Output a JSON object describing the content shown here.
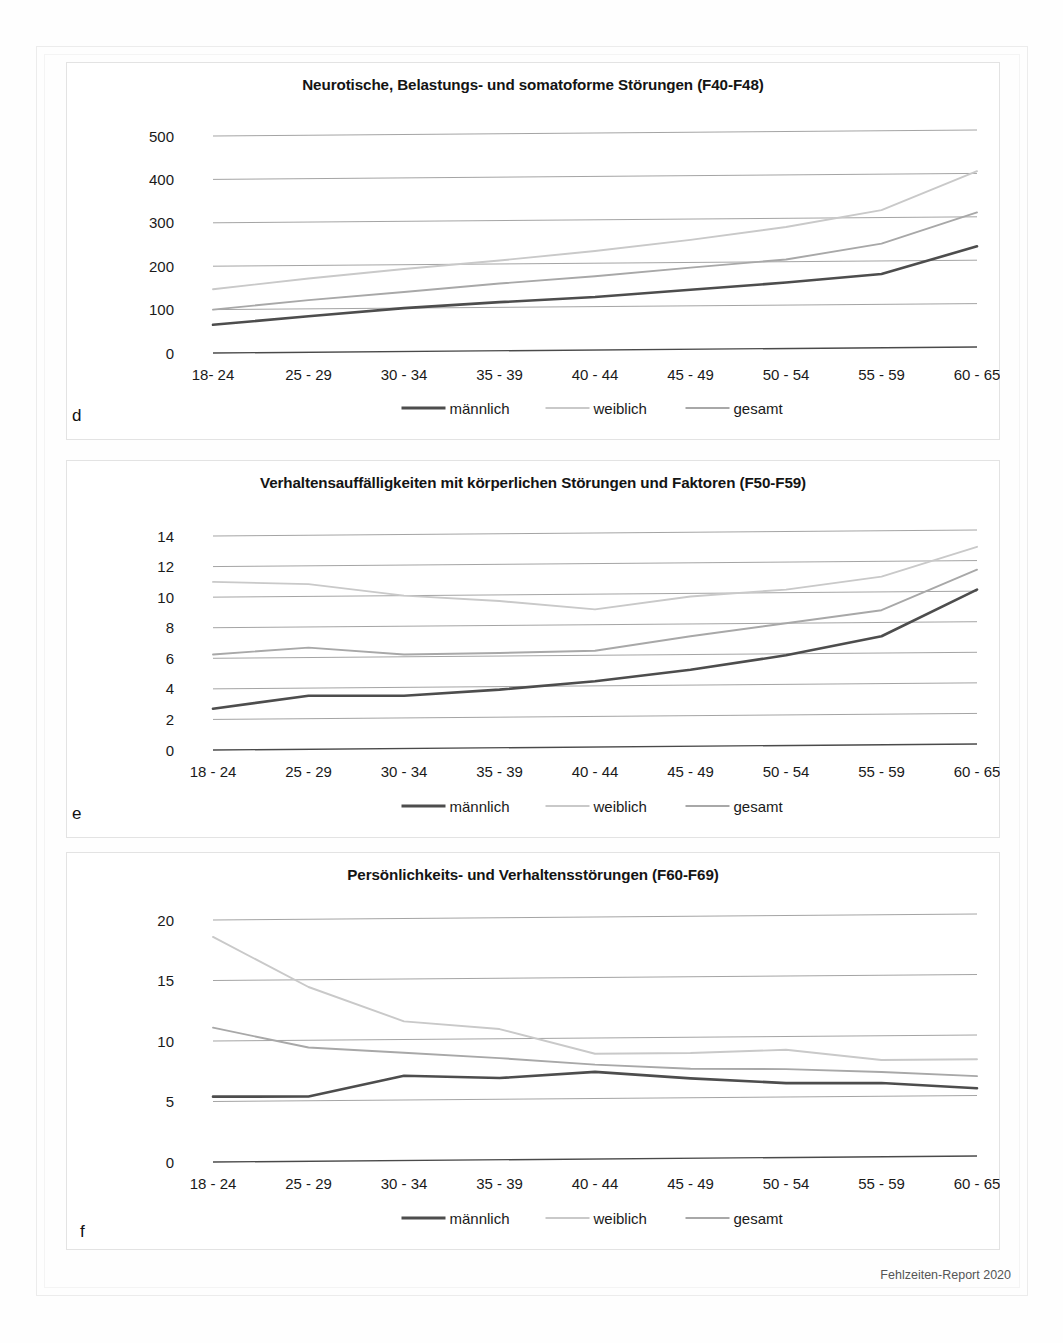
{
  "footer": {
    "text": "Fehlzeiten-Report 2020"
  },
  "legend": {
    "items": [
      {
        "label": "männlich",
        "color": "#4d4d4d"
      },
      {
        "label": "weiblich",
        "color": "#c9c9c9"
      },
      {
        "label": "gesamt",
        "color": "#a8a8a8"
      }
    ]
  },
  "panels": [
    {
      "letter": "d"
    },
    {
      "letter": "e"
    },
    {
      "letter": "f"
    }
  ],
  "chart_data": [
    {
      "type": "line",
      "panel": "d",
      "title": "Neurotische, Belastungs- und somatoforme Störungen (F40-F48)",
      "xlabel": "",
      "ylabel": "",
      "ylim": [
        0,
        500
      ],
      "yticks": [
        0,
        100,
        200,
        300,
        400,
        500
      ],
      "grid": true,
      "legend_position": "bottom",
      "categories": [
        "18- 24",
        "25 - 29",
        "30 - 34",
        "35 - 39",
        "40 - 44",
        "45 - 49",
        "50 - 54",
        "55 - 59",
        "60 - 65"
      ],
      "series": [
        {
          "name": "männlich",
          "color": "#4d4d4d",
          "values": [
            65,
            83,
            100,
            112,
            122,
            137,
            152,
            170,
            232
          ]
        },
        {
          "name": "weiblich",
          "color": "#c9c9c9",
          "values": [
            147,
            170,
            190,
            208,
            228,
            252,
            280,
            317,
            405
          ]
        },
        {
          "name": "gesamt",
          "color": "#a8a8a8",
          "values": [
            100,
            120,
            137,
            155,
            170,
            188,
            205,
            240,
            310
          ]
        }
      ]
    },
    {
      "type": "line",
      "panel": "e",
      "title": "Verhaltensauffälligkeiten mit körperlichen Störungen und Faktoren (F50-F59)",
      "xlabel": "",
      "ylabel": "",
      "ylim": [
        0,
        14
      ],
      "yticks": [
        0,
        2,
        4,
        6,
        8,
        10,
        12,
        14
      ],
      "grid": true,
      "legend_position": "bottom",
      "categories": [
        "18 - 24",
        "25 - 29",
        "30 - 34",
        "35 - 39",
        "40 - 44",
        "45 - 49",
        "50 - 54",
        "55 - 59",
        "60 - 65"
      ],
      "series": [
        {
          "name": "männlich",
          "color": "#4d4d4d",
          "values": [
            2.7,
            3.5,
            3.45,
            3.8,
            4.3,
            5.0,
            5.9,
            7.1,
            10.1
          ]
        },
        {
          "name": "weiblich",
          "color": "#c9c9c9",
          "values": [
            11.0,
            10.8,
            10.0,
            9.6,
            9.0,
            9.8,
            10.2,
            11.0,
            12.9
          ]
        },
        {
          "name": "gesamt",
          "color": "#a8a8a8",
          "values": [
            6.25,
            6.65,
            6.15,
            6.2,
            6.3,
            7.2,
            8.0,
            8.8,
            11.4
          ]
        }
      ]
    },
    {
      "type": "line",
      "panel": "f",
      "title": "Persönlichkeits- und Verhaltensstörungen (F60-F69)",
      "xlabel": "",
      "ylabel": "",
      "ylim": [
        0,
        20
      ],
      "yticks": [
        0,
        5,
        10,
        15,
        20
      ],
      "grid": true,
      "legend_position": "bottom",
      "categories": [
        "18 - 24",
        "25 - 29",
        "30 - 34",
        "35 - 39",
        "40 - 44",
        "45 - 49",
        "50 - 54",
        "55 - 59",
        "60 - 65"
      ],
      "series": [
        {
          "name": "männlich",
          "color": "#4d4d4d",
          "values": [
            5.4,
            5.35,
            7.0,
            6.75,
            7.2,
            6.6,
            6.15,
            6.1,
            5.6
          ]
        },
        {
          "name": "weiblich",
          "color": "#c9c9c9",
          "values": [
            18.6,
            14.4,
            11.5,
            10.8,
            8.7,
            8.7,
            8.9,
            8.0,
            8.0
          ]
        },
        {
          "name": "gesamt",
          "color": "#a8a8a8",
          "values": [
            11.1,
            9.4,
            8.9,
            8.4,
            7.8,
            7.4,
            7.3,
            7.0,
            6.6
          ]
        }
      ]
    }
  ]
}
